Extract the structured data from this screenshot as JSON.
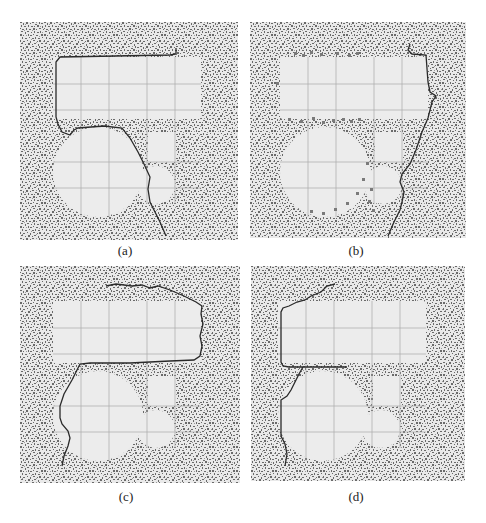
{
  "figure": {
    "panels": [
      {
        "id": "a",
        "caption": "(a)"
      },
      {
        "id": "b",
        "caption": "(b)"
      },
      {
        "id": "c",
        "caption": "(c)"
      },
      {
        "id": "d",
        "caption": "(d)"
      }
    ],
    "colors": {
      "background_noise_light": "#e9e9e9",
      "background_noise_dark": "#6a6a6a",
      "shape_fill": "#ececec",
      "grid_line": "#a9a9a9",
      "boundary_curve": "#2a2a2a",
      "boundary_markers_b": "#7a7a7a"
    }
  }
}
